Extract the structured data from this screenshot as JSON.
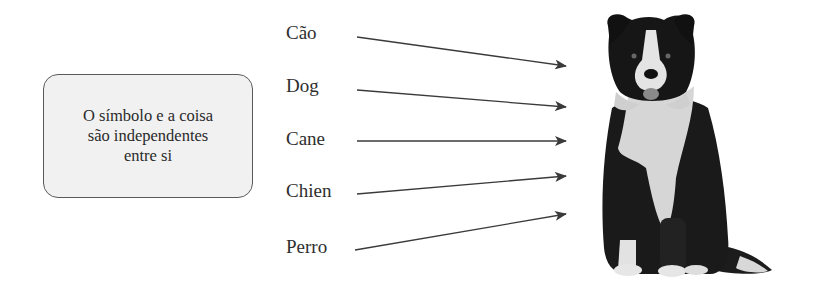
{
  "concept_box": {
    "lines": [
      "O símbolo e a coisa",
      "são independentes",
      "entre si"
    ],
    "fill_color": "#f1f1f1",
    "border_color": "#5a5a5a"
  },
  "words": [
    {
      "label": "Cão",
      "x": 286,
      "y": 22
    },
    {
      "label": "Dog",
      "x": 286,
      "y": 75
    },
    {
      "label": "Cane",
      "x": 286,
      "y": 128
    },
    {
      "label": "Chien",
      "x": 286,
      "y": 180
    },
    {
      "label": "Perro",
      "x": 286,
      "y": 236
    }
  ],
  "arrows": [
    {
      "from": [
        357,
        37
      ],
      "to": [
        566,
        66
      ]
    },
    {
      "from": [
        357,
        90
      ],
      "to": [
        566,
        107
      ]
    },
    {
      "from": [
        357,
        141
      ],
      "to": [
        566,
        141
      ]
    },
    {
      "from": [
        357,
        194
      ],
      "to": [
        566,
        176
      ]
    },
    {
      "from": [
        355,
        250
      ],
      "to": [
        566,
        214
      ]
    }
  ],
  "arrow_color": "#3a3a3a",
  "image": {
    "subject": "dog-photo",
    "description": "Black and white border collie sitting, facing forward"
  }
}
